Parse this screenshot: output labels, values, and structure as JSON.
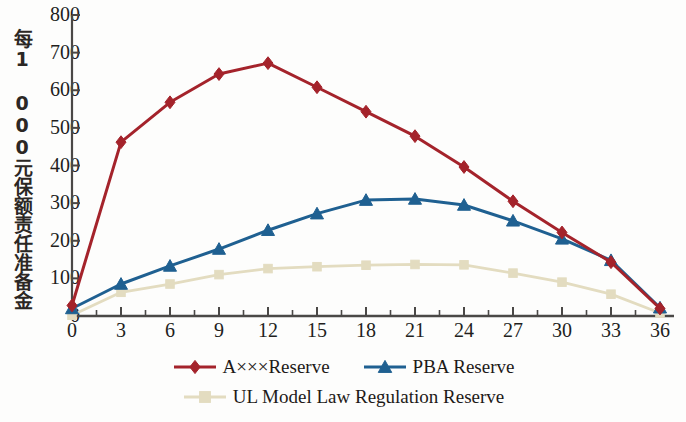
{
  "chart_data": {
    "type": "line",
    "title": "",
    "subtitle": "",
    "xlabel": "",
    "ylabel": "每1 000元保额责任准备金",
    "x": [
      0,
      3,
      6,
      9,
      12,
      15,
      18,
      21,
      24,
      27,
      30,
      33,
      36
    ],
    "xtick_labels": [
      "0",
      "3",
      "6",
      "9",
      "12",
      "15",
      "18",
      "21",
      "24",
      "27",
      "30",
      "33",
      "36"
    ],
    "ytick_labels": [
      "0",
      "100",
      "200",
      "300",
      "400",
      "500",
      "600",
      "700",
      "800"
    ],
    "ytick_values": [
      0,
      100,
      200,
      300,
      400,
      500,
      600,
      700,
      800
    ],
    "xlim": [
      0,
      36
    ],
    "ylim": [
      0,
      800
    ],
    "grid": false,
    "legend_position": "bottom",
    "minor_xticks_per_interval": 1,
    "series": [
      {
        "name": "A×××Reserve",
        "color": "#a4232b",
        "marker": "diamond",
        "values": [
          28,
          462,
          568,
          643,
          672,
          608,
          543,
          478,
          396,
          305,
          222,
          143,
          20
        ]
      },
      {
        "name": "PBA Reserve",
        "color": "#1f6091",
        "marker": "triangle",
        "values": [
          20,
          85,
          133,
          178,
          228,
          272,
          308,
          311,
          295,
          253,
          205,
          148,
          22
        ]
      },
      {
        "name": "UL Model Law Regulation Reserve",
        "color": "#e3dcc0",
        "marker": "square",
        "values": [
          2,
          63,
          85,
          110,
          126,
          131,
          135,
          137,
          136,
          114,
          90,
          58,
          8
        ]
      }
    ]
  },
  "axes": {
    "y_title": "每1 000元保额责任准备金",
    "axis_color": "#4a4846"
  },
  "legend": {
    "rows": [
      [
        "A×××Reserve",
        "PBA Reserve"
      ],
      [
        "UL Model Law Regulation Reserve"
      ]
    ],
    "entries": [
      {
        "label": "A×××Reserve",
        "color": "#a4232b",
        "marker": "diamond"
      },
      {
        "label": "PBA Reserve",
        "color": "#1f6091",
        "marker": "triangle"
      },
      {
        "label": "UL Model Law Regulation Reserve",
        "color": "#e3dcc0",
        "marker": "square"
      }
    ]
  }
}
